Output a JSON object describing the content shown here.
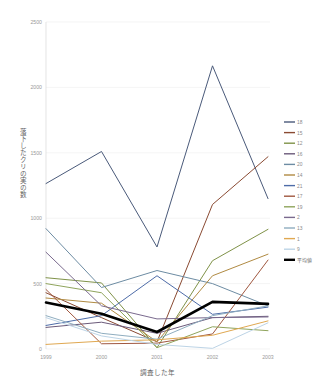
{
  "chart_data": {
    "type": "line",
    "title": "",
    "xlabel": "調査した年",
    "ylabel": "落下したクリの実の数",
    "x": [
      "1999",
      "2000",
      "2001",
      "2002",
      "2003"
    ],
    "xticklabels": [
      "1999",
      "2000",
      "2001",
      "2002",
      "2003"
    ],
    "yticklabels": [
      "0",
      "500",
      "1000",
      "1500",
      "2000",
      "2500"
    ],
    "yticks": [
      0,
      500,
      1000,
      1500,
      2000,
      2500
    ],
    "ylim": [
      0,
      2500
    ],
    "grid": "horizontal",
    "legend_position": "right",
    "series": [
      {
        "name": "18",
        "color": "#4a5a7a",
        "values": [
          1265,
          1510,
          780,
          2165,
          1150
        ]
      },
      {
        "name": "15",
        "color": "#8a4a32",
        "values": [
          430,
          240,
          55,
          1105,
          1470
        ]
      },
      {
        "name": "12",
        "color": "#7f9248",
        "values": [
          545,
          505,
          10,
          675,
          915
        ]
      },
      {
        "name": "16",
        "color": "#6b5a7a",
        "values": [
          165,
          205,
          120,
          240,
          250
        ]
      },
      {
        "name": "20",
        "color": "#6d8ca3",
        "values": [
          920,
          470,
          600,
          500,
          330
        ]
      },
      {
        "name": "14",
        "color": "#b08a42",
        "values": [
          390,
          350,
          55,
          560,
          725
        ]
      },
      {
        "name": "21",
        "color": "#4e6ca8",
        "values": [
          180,
          255,
          560,
          265,
          320
        ]
      },
      {
        "name": "17",
        "color": "#a0573f",
        "values": [
          455,
          40,
          45,
          115,
          680
        ]
      },
      {
        "name": "19",
        "color": "#8fa45c",
        "values": [
          500,
          430,
          10,
          170,
          140
        ]
      },
      {
        "name": "2",
        "color": "#7a6a8e",
        "values": [
          740,
          330,
          230,
          240,
          245
        ]
      },
      {
        "name": "13",
        "color": "#8fadbf",
        "values": [
          255,
          120,
          75,
          255,
          330
        ]
      },
      {
        "name": "1",
        "color": "#e0a851",
        "values": [
          35,
          60,
          70,
          105,
          215
        ]
      },
      {
        "name": "9",
        "color": "#bdd4e6",
        "values": [
          240,
          100,
          35,
          5,
          200
        ]
      },
      {
        "name": "平均値",
        "color": "#000000",
        "values": [
          355,
          270,
          130,
          360,
          345
        ]
      }
    ]
  },
  "legend": {
    "items": [
      {
        "label": "18"
      },
      {
        "label": "15"
      },
      {
        "label": "12"
      },
      {
        "label": "16"
      },
      {
        "label": "20"
      },
      {
        "label": "14"
      },
      {
        "label": "21"
      },
      {
        "label": "17"
      },
      {
        "label": "19"
      },
      {
        "label": "2"
      },
      {
        "label": "13"
      },
      {
        "label": "1"
      },
      {
        "label": "9"
      },
      {
        "label": "平均値"
      }
    ]
  }
}
